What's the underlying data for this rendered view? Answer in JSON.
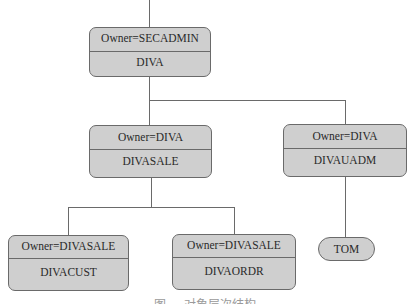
{
  "diagram": {
    "type": "ownership-hierarchy",
    "nodes": [
      {
        "id": "diva",
        "owner_label": "Owner=SECADMIN",
        "name": "DIVA"
      },
      {
        "id": "divasale",
        "owner_label": "Owner=DIVA",
        "name": "DIVASALE"
      },
      {
        "id": "divauadm",
        "owner_label": "Owner=DIVA",
        "name": "DIVAUADM"
      },
      {
        "id": "divacust",
        "owner_label": "Owner=DIVASALE",
        "name": "DIVACUST"
      },
      {
        "id": "divaordr",
        "owner_label": "Owner=DIVASALE",
        "name": "DIVAORDR"
      },
      {
        "id": "tom",
        "name": "TOM",
        "shape": "rounded-pill"
      }
    ],
    "edges": [
      [
        "diva",
        "divasale"
      ],
      [
        "diva",
        "divauadm"
      ],
      [
        "divasale",
        "divacust"
      ],
      [
        "divasale",
        "divaordr"
      ],
      [
        "divauadm",
        "tom"
      ]
    ],
    "colors": {
      "node_fill": "#cfcfcf",
      "stroke": "#6a6a6a",
      "text": "#2a2a2a"
    },
    "caption": "图 — 对象层次结构"
  }
}
